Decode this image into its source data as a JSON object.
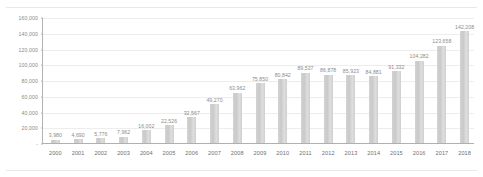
{
  "chart_data": {
    "type": "bar",
    "title": "",
    "subtitle": "",
    "xlabel": "",
    "ylabel": "",
    "ylim": [
      0,
      160000
    ],
    "grid": true,
    "legend": null,
    "categories": [
      "2000",
      "2001",
      "2002",
      "2003",
      "2004",
      "2005",
      "2006",
      "2007",
      "2008",
      "2009",
      "2010",
      "2011",
      "2012",
      "2013",
      "2014",
      "2015",
      "2016",
      "2017",
      "2018"
    ],
    "values": [
      3980,
      4690,
      5776,
      7962,
      16002,
      22526,
      32567,
      49270,
      63962,
      75850,
      80842,
      89537,
      86878,
      85923,
      84881,
      91332,
      104282,
      123658,
      142208
    ],
    "data_labels": [
      "3,980",
      "4,690",
      "5,776",
      "7,962",
      "16,002",
      "22,526",
      "32,567",
      "49,270",
      "63,962",
      "75,850",
      "80,842",
      "89,537",
      "86,878",
      "85,923",
      "84,881",
      "91,332",
      "104,282",
      "123,658",
      "142,208"
    ],
    "y_ticks": [
      0,
      20000,
      40000,
      60000,
      80000,
      100000,
      120000,
      140000,
      160000
    ],
    "y_tick_labels": [
      "-",
      "20,000",
      "40,000",
      "60,000",
      "80,000",
      "100,000",
      "120,000",
      "140,000",
      "160,000"
    ],
    "colors": {
      "bar": "#d0d0d0",
      "grid": "#ededed",
      "axis": "#b0b0b0",
      "label_text": "#8a8a8a",
      "tick_text": "#6f6f6f",
      "background": "#ffffff"
    }
  }
}
